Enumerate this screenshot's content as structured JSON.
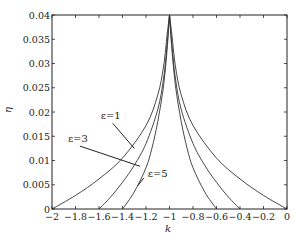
{
  "chart_data": {
    "type": "line",
    "title": "",
    "xlabel": "k",
    "ylabel": "η",
    "xlim": [
      -2,
      0
    ],
    "ylim": [
      0,
      0.04
    ],
    "grid": false,
    "legend": "none (inline annotations)",
    "x_ticks": [
      -2,
      -1.8,
      -1.6,
      -1.4,
      -1.2,
      -1,
      -0.8,
      -0.6,
      -0.4,
      -0.2,
      0
    ],
    "x_tick_labels": [
      "−2",
      "−1.8",
      "−1.6",
      "−1.4",
      "−1.2",
      "−1",
      "−0.8",
      "−0.6",
      "−0.4",
      "−0.2",
      "0"
    ],
    "y_ticks": [
      0,
      0.005,
      0.01,
      0.015,
      0.02,
      0.025,
      0.03,
      0.035,
      0.04
    ],
    "y_tick_labels": [
      "0",
      "0.005",
      "0.01",
      "0.015",
      "0.02",
      "0.025",
      "0.03",
      "0.035",
      "0.04"
    ],
    "series": [
      {
        "name": "ε=1",
        "label": "ε=1",
        "left_branch": {
          "k": [
            -2,
            -1.8,
            -1.6,
            -1.4,
            -1.2,
            -1.1,
            -1.05,
            -1.02,
            -1.0
          ],
          "eta": [
            0,
            0.0028,
            0.0062,
            0.0105,
            0.0172,
            0.0235,
            0.0295,
            0.036,
            0.04
          ]
        },
        "right_branch": {
          "k": [
            -1.0,
            -0.98,
            -0.95,
            -0.9,
            -0.8,
            -0.6,
            -0.4,
            -0.2,
            0
          ],
          "eta": [
            0.04,
            0.036,
            0.0295,
            0.0235,
            0.0172,
            0.0105,
            0.0062,
            0.0028,
            0
          ]
        }
      },
      {
        "name": "ε=3",
        "label": "ε=3",
        "left_branch": {
          "k": [
            -1.6,
            -1.5,
            -1.4,
            -1.3,
            -1.2,
            -1.1,
            -1.05,
            -1.02,
            -1.0
          ],
          "eta": [
            0,
            0.0025,
            0.0055,
            0.009,
            0.0135,
            0.0205,
            0.027,
            0.034,
            0.04
          ]
        },
        "right_branch": {
          "k": [
            -1.0,
            -0.98,
            -0.95,
            -0.9,
            -0.8,
            -0.7,
            -0.6,
            -0.5,
            -0.4
          ],
          "eta": [
            0.04,
            0.034,
            0.027,
            0.0205,
            0.0135,
            0.009,
            0.0055,
            0.0025,
            0
          ]
        }
      },
      {
        "name": "ε=5",
        "label": "ε=5",
        "left_branch": {
          "k": [
            -1.4,
            -1.3,
            -1.2,
            -1.15,
            -1.1,
            -1.05,
            -1.02,
            -1.0
          ],
          "eta": [
            0,
            0.0035,
            0.0085,
            0.0125,
            0.018,
            0.0255,
            0.033,
            0.04
          ]
        },
        "right_branch": {
          "k": [
            -1.0,
            -0.98,
            -0.95,
            -0.9,
            -0.85,
            -0.8,
            -0.7,
            -0.6
          ],
          "eta": [
            0.04,
            0.033,
            0.0255,
            0.018,
            0.0125,
            0.0085,
            0.0035,
            0
          ]
        }
      }
    ],
    "annotations": [
      {
        "text": "ε=1",
        "text_pos": [
          -1.5,
          0.0185
        ],
        "arrow_to": [
          -1.3,
          0.0125
        ]
      },
      {
        "text": "ε=3",
        "text_pos": [
          -1.78,
          0.0138
        ],
        "arrow_to": [
          -1.25,
          0.0088
        ]
      },
      {
        "text": "ε=5",
        "text_pos": [
          -1.1,
          0.0066
        ],
        "arrow_to": [
          -1.27,
          0.0048
        ]
      }
    ]
  }
}
